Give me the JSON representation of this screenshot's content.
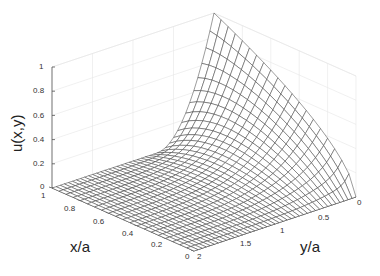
{
  "chart_data": {
    "type": "surface",
    "title": "",
    "xlabel": "x/a",
    "ylabel": "y/a",
    "zlabel": "u(x,y)",
    "xlim": [
      0,
      1
    ],
    "ylim": [
      0,
      2
    ],
    "zlim": [
      0,
      1
    ],
    "x_ticks": [
      "0",
      "0.2",
      "0.4",
      "0.6",
      "0.8",
      "1"
    ],
    "y_ticks": [
      "0",
      "0.5",
      "1",
      "1.5",
      "2"
    ],
    "z_ticks": [
      "0",
      "0.2",
      "0.4",
      "0.6",
      "0.8",
      "1"
    ],
    "grid": true,
    "mesh_resolution": {
      "nx": 20,
      "ny": 40
    },
    "sample_values": [
      {
        "x": 1.0,
        "y": 0.0,
        "u": 1.0
      },
      {
        "x": 0.9,
        "y": 0.1,
        "u": 0.85
      },
      {
        "x": 0.5,
        "y": 0.0,
        "u": 0.5
      },
      {
        "x": 0.0,
        "y": 0.0,
        "u": 0.0
      },
      {
        "x": 0.9,
        "y": 0.5,
        "u": 0.35
      },
      {
        "x": 0.5,
        "y": 1.0,
        "u": 0.05
      },
      {
        "x": 1.0,
        "y": 2.0,
        "u": 0.0
      }
    ]
  },
  "labels": {
    "x": "x/a",
    "y": "y/a",
    "z": "u(x,y)"
  },
  "ticks": {
    "z": [
      "0",
      "0.2",
      "0.4",
      "0.6",
      "0.8",
      "1"
    ],
    "x": [
      "1",
      "0.8",
      "0.6",
      "0.4",
      "0.2",
      "0"
    ],
    "y": [
      "2",
      "1.5",
      "1",
      "0.5",
      "0"
    ]
  }
}
